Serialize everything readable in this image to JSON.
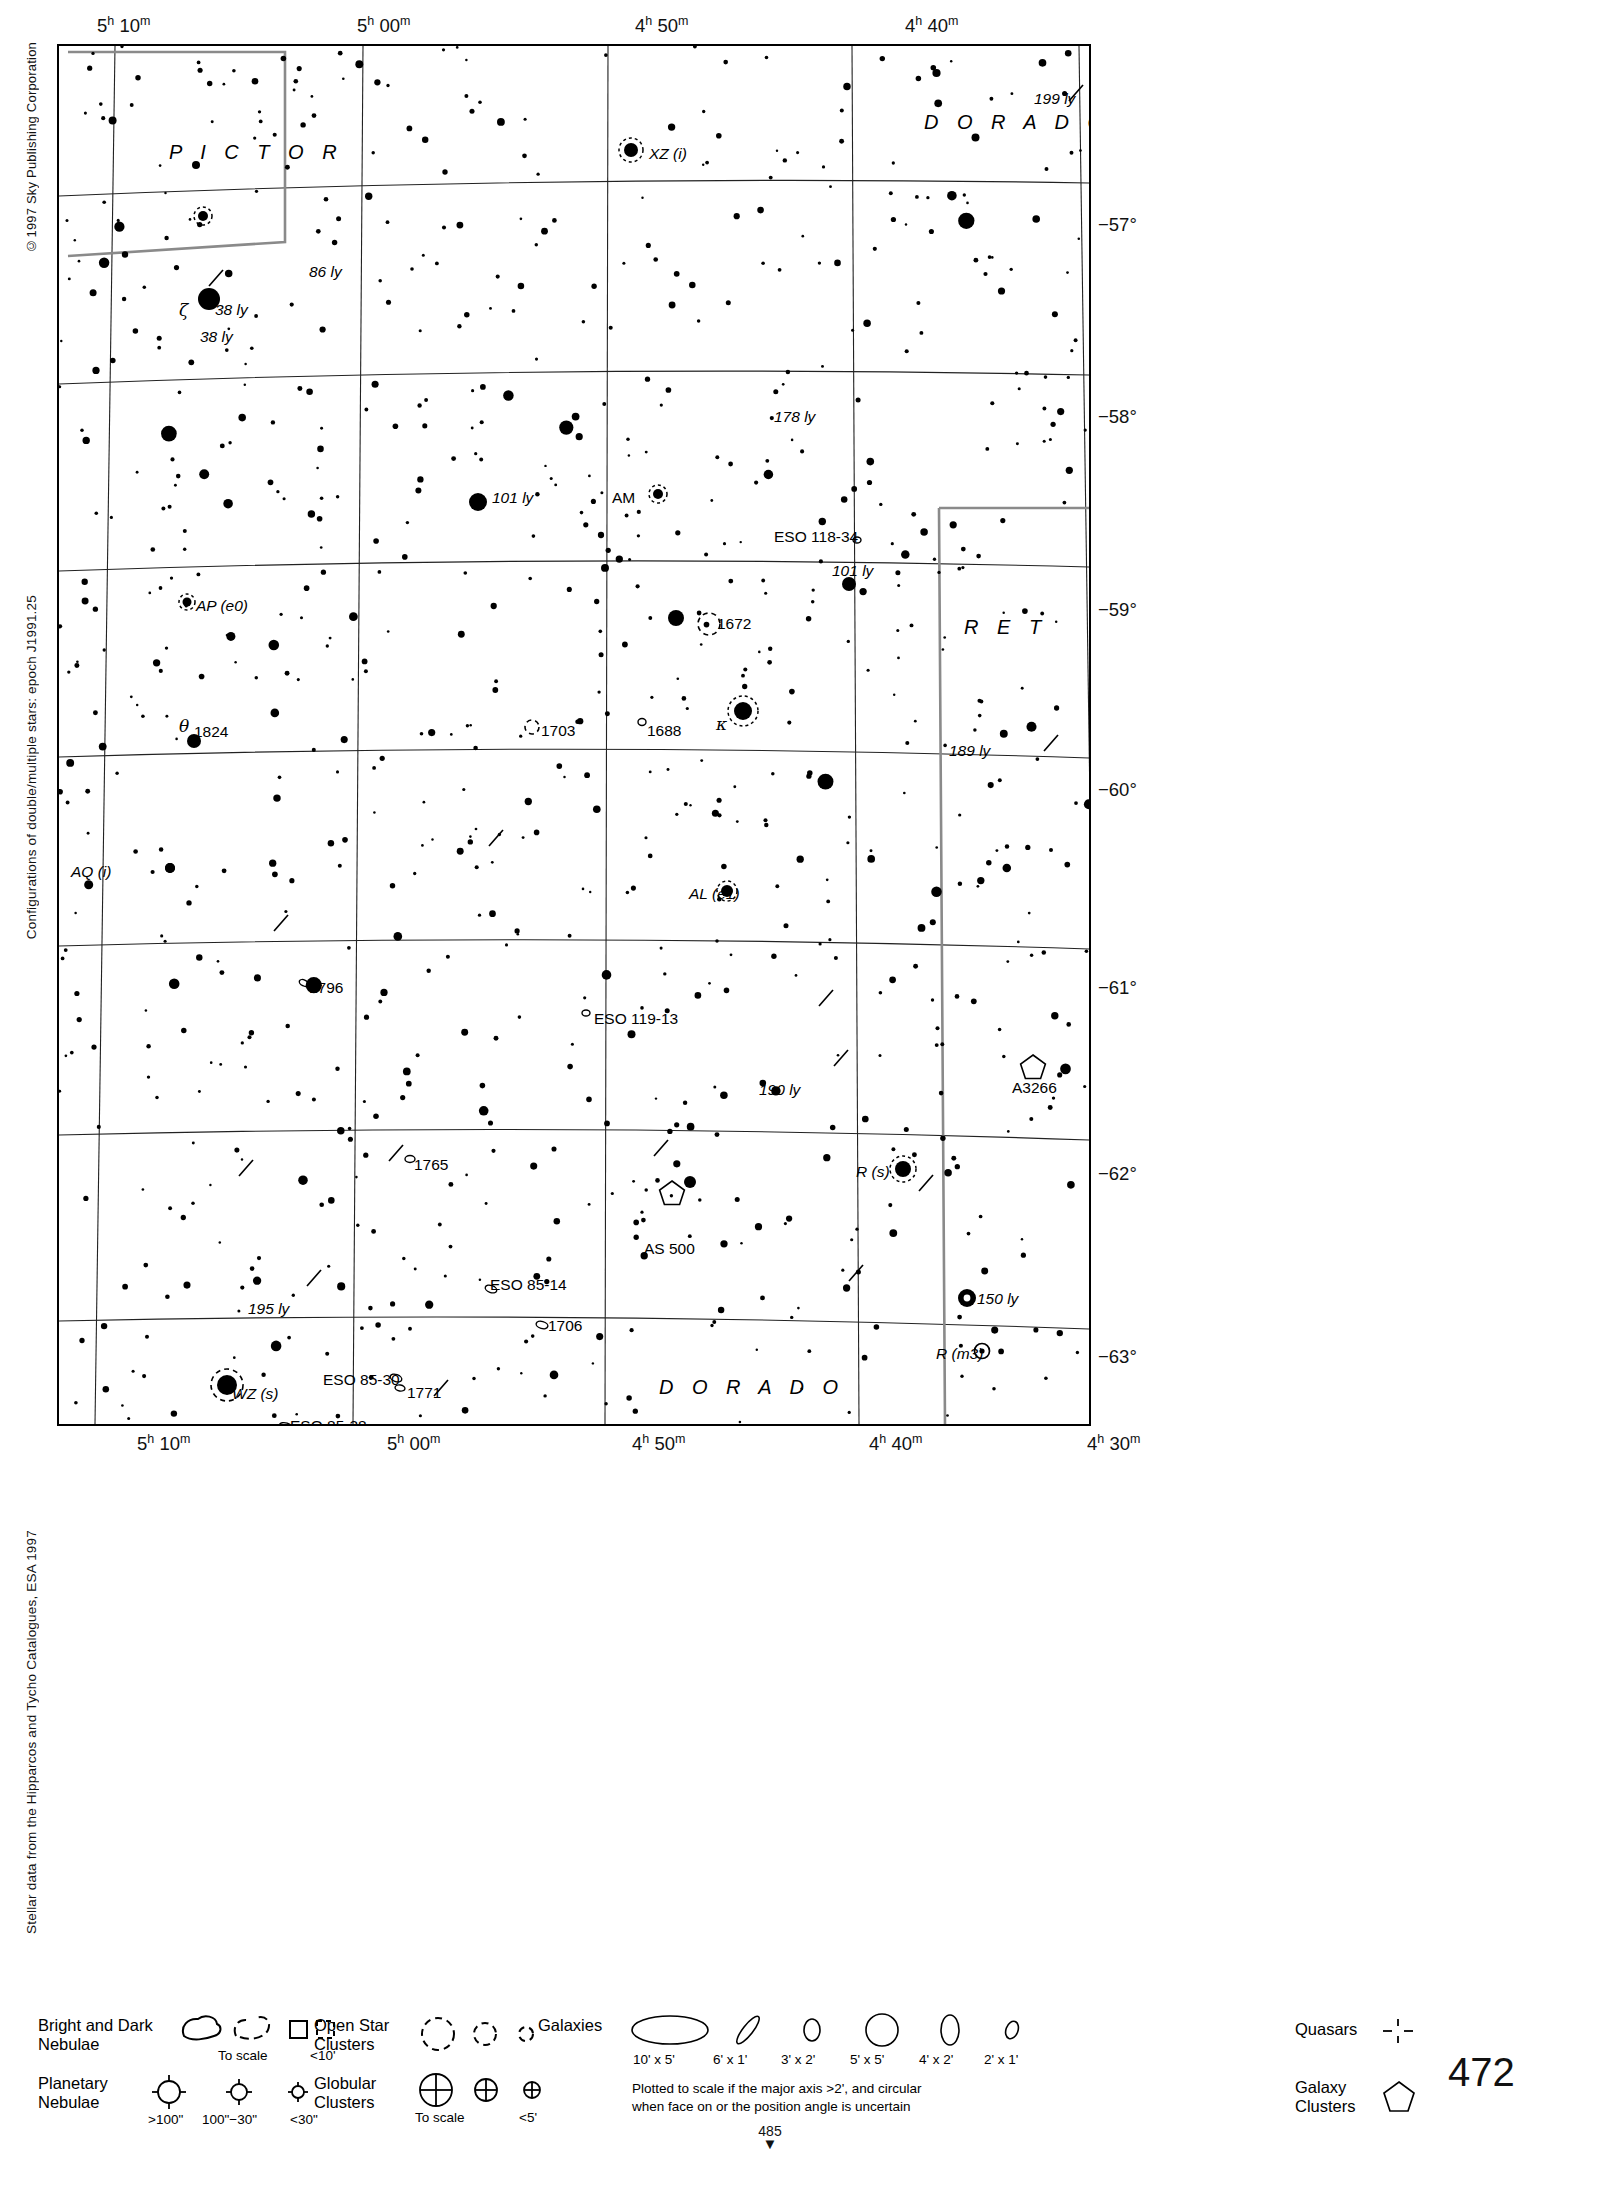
{
  "credits": {
    "copyright": "©1997 Sky Publishing Corporation",
    "configurations": "Configurations of double/multiple stars: epoch J1991.25",
    "source": "Stellar data from the Hipparcos and Tycho Catalogues, ESA 1997"
  },
  "page_number": "472",
  "next_page": {
    "number": "485",
    "arrow": "▼"
  },
  "chart": {
    "ra_labels_top": [
      {
        "text": "5h 10m",
        "h": "5",
        "m": "10",
        "x": 40
      },
      {
        "text": "5h 00m",
        "h": "5",
        "m": "00",
        "x": 300
      },
      {
        "text": "4h 50m",
        "h": "4",
        "m": "50",
        "x": 578
      },
      {
        "text": "4h 40m",
        "h": "4",
        "m": "40",
        "x": 848
      }
    ],
    "ra_labels_bottom": [
      {
        "text": "5h 10m",
        "h": "5",
        "m": "10",
        "x": 80
      },
      {
        "text": "5h 00m",
        "h": "5",
        "m": "00",
        "x": 330
      },
      {
        "text": "4h 50m",
        "h": "4",
        "m": "50",
        "x": 575
      },
      {
        "text": "4h 40m",
        "h": "4",
        "m": "40",
        "x": 812
      },
      {
        "text": "4h 30m",
        "h": "4",
        "m": "30",
        "x": 1030
      }
    ],
    "dec_labels": [
      {
        "text": "−57°",
        "y": 181
      },
      {
        "text": "−58°",
        "y": 373
      },
      {
        "text": "−59°",
        "y": 566
      },
      {
        "text": "−60°",
        "y": 746
      },
      {
        "text": "−61°",
        "y": 944
      },
      {
        "text": "−62°",
        "y": 1130
      },
      {
        "text": "−63°",
        "y": 1313
      }
    ],
    "constellations": [
      {
        "name": "P I C T O R",
        "x": 110,
        "y": 105
      },
      {
        "name": "D O R A D O",
        "x": 865,
        "y": 75
      },
      {
        "name": "R E T",
        "x": 905,
        "y": 580
      },
      {
        "name": "D O R A D O",
        "x": 600,
        "y": 1340
      }
    ],
    "object_labels": [
      {
        "text": "199 ly",
        "x": 975,
        "y": 45,
        "style": "it"
      },
      {
        "text": "XZ (i)",
        "x": 590,
        "y": 100,
        "style": "it"
      },
      {
        "text": "86 ly",
        "x": 250,
        "y": 218,
        "style": "it"
      },
      {
        "text": "38 ly",
        "x": 156,
        "y": 256,
        "style": "it"
      },
      {
        "text": "ζ",
        "x": 120,
        "y": 256,
        "style": "gk"
      },
      {
        "text": "38 ly",
        "x": 141,
        "y": 283,
        "style": "it"
      },
      {
        "text": "178 ly",
        "x": 715,
        "y": 363,
        "style": "it"
      },
      {
        "text": "101 ly",
        "x": 433,
        "y": 444,
        "style": "it"
      },
      {
        "text": "AM",
        "x": 553,
        "y": 444,
        "style": ""
      },
      {
        "text": "ESO 118-34",
        "x": 715,
        "y": 483,
        "style": ""
      },
      {
        "text": "101 ly",
        "x": 773,
        "y": 517,
        "style": "it"
      },
      {
        "text": "AP (e0)",
        "x": 137,
        "y": 552,
        "style": "it"
      },
      {
        "text": "1672",
        "x": 658,
        "y": 570,
        "style": ""
      },
      {
        "text": "1824",
        "x": 135,
        "y": 678,
        "style": ""
      },
      {
        "text": "θ",
        "x": 120,
        "y": 672,
        "style": "gk"
      },
      {
        "text": "1703",
        "x": 482,
        "y": 677,
        "style": ""
      },
      {
        "text": "1688",
        "x": 588,
        "y": 677,
        "style": ""
      },
      {
        "text": "κ",
        "x": 657,
        "y": 670,
        "style": "gk"
      },
      {
        "text": "189 ly",
        "x": 890,
        "y": 697,
        "style": "it"
      },
      {
        "text": "AQ (i)",
        "x": 12,
        "y": 818,
        "style": "it"
      },
      {
        "text": "AL (e1)",
        "x": 630,
        "y": 840,
        "style": "it"
      },
      {
        "text": "1796",
        "x": 250,
        "y": 934,
        "style": ""
      },
      {
        "text": "ESO 119-13",
        "x": 535,
        "y": 965,
        "style": ""
      },
      {
        "text": "190 ly",
        "x": 700,
        "y": 1036,
        "style": "it"
      },
      {
        "text": "A3266",
        "x": 953,
        "y": 1034,
        "style": ""
      },
      {
        "text": "1765",
        "x": 355,
        "y": 1111,
        "style": ""
      },
      {
        "text": "R (s)",
        "x": 797,
        "y": 1118,
        "style": "it"
      },
      {
        "text": "AS 500",
        "x": 585,
        "y": 1195,
        "style": ""
      },
      {
        "text": "ESO 85-14",
        "x": 431,
        "y": 1231,
        "style": ""
      },
      {
        "text": "150 ly",
        "x": 918,
        "y": 1245,
        "style": "it"
      },
      {
        "text": "195 ly",
        "x": 189,
        "y": 1255,
        "style": "it"
      },
      {
        "text": "1706",
        "x": 489,
        "y": 1272,
        "style": ""
      },
      {
        "text": "R (m3)",
        "x": 877,
        "y": 1300,
        "style": "it"
      },
      {
        "text": "ESO 85-30",
        "x": 264,
        "y": 1326,
        "style": ""
      },
      {
        "text": "1771",
        "x": 348,
        "y": 1339,
        "style": ""
      },
      {
        "text": "WZ (s)",
        "x": 173,
        "y": 1340,
        "style": "it"
      },
      {
        "text": "ESO 85-38",
        "x": 231,
        "y": 1372,
        "style": ""
      }
    ]
  },
  "legend": {
    "nebulae": {
      "title_line1": "Bright and Dark",
      "title_line2": "Nebulae",
      "sub_to_scale": "To scale",
      "sub_small": "<10'"
    },
    "planetary": {
      "title_line1": "Planetary",
      "title_line2": "Nebulae",
      "sizes": [
        ">100\"",
        "100\"−30\"",
        "<30\""
      ]
    },
    "open_clusters": {
      "title_line1": "Open Star",
      "title_line2": "Clusters"
    },
    "globular_clusters": {
      "title_line1": "Globular",
      "title_line2": "Clusters",
      "sub_to_scale": "To scale",
      "sub_small": "<5'"
    },
    "galaxies": {
      "title": "Galaxies",
      "sizes": [
        "10' x 5'",
        "6' x 1'",
        "3' x 2'",
        "5' x 5'",
        "4' x 2'",
        "2' x 1'"
      ],
      "note_line1": "Plotted to scale if the major axis >2', and circular",
      "note_line2": "when face on or the position angle is uncertain"
    },
    "quasars": {
      "title": "Quasars"
    },
    "galaxy_clusters": {
      "title_line1": "Galaxy",
      "title_line2": "Clusters"
    }
  },
  "starfield": {
    "seed": 472,
    "count": 820,
    "note": "magnitude-scaled dots"
  }
}
